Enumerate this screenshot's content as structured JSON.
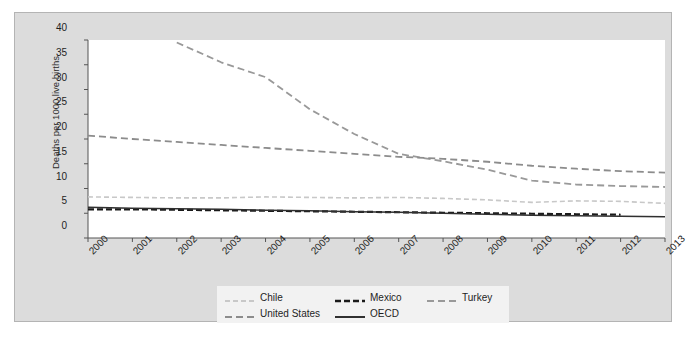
{
  "chart_data": {
    "type": "line",
    "title": "",
    "subtitle": "",
    "xlabel": "",
    "ylabel": "Deaths per 1000 live births",
    "xlim": [
      2000,
      2013
    ],
    "ylim": [
      0,
      40
    ],
    "yticks": [
      0,
      5,
      10,
      15,
      20,
      25,
      30,
      35,
      40
    ],
    "x": [
      2000,
      2001,
      2002,
      2003,
      2004,
      2005,
      2006,
      2007,
      2008,
      2009,
      2010,
      2011,
      2012,
      2013
    ],
    "categories": [
      "2000",
      "2001",
      "2002",
      "2003",
      "2004",
      "2005",
      "2006",
      "2007",
      "2008",
      "2009",
      "2010",
      "2011",
      "2012",
      "2013"
    ],
    "grid": false,
    "legend_position": "bottom",
    "series": [
      {
        "name": "Chile",
        "color": "#c8c8c8",
        "style": "dashed",
        "x": [
          2000,
          2001,
          2002,
          2003,
          2004,
          2005,
          2006,
          2007,
          2008,
          2009,
          2010,
          2011,
          2012,
          2013
        ],
        "values": [
          8.3,
          8.2,
          8.1,
          8.1,
          8.3,
          8.2,
          8.1,
          8.2,
          8.0,
          7.7,
          7.2,
          7.5,
          7.4,
          7.0
        ]
      },
      {
        "name": "Mexico",
        "color": "#1a1a1a",
        "style": "dashed",
        "x": [
          2000,
          2001,
          2002,
          2003,
          2004,
          2005,
          2006,
          2007,
          2008,
          2009,
          2010,
          2011,
          2012
        ],
        "values": [
          5.8,
          5.8,
          5.7,
          5.6,
          5.5,
          5.4,
          5.3,
          5.2,
          5.1,
          5.0,
          4.9,
          4.8,
          4.7
        ]
      },
      {
        "name": "Turkey",
        "color": "#999999",
        "style": "dashed",
        "x": [
          2002,
          2003,
          2004,
          2005,
          2006,
          2007,
          2008,
          2009,
          2010,
          2011,
          2012,
          2013
        ],
        "values": [
          39.5,
          35.5,
          32.5,
          26.0,
          21.0,
          17.0,
          15.5,
          13.8,
          11.6,
          10.8,
          10.5,
          10.3
        ]
      },
      {
        "name": "United States",
        "color": "#8c8c8c",
        "style": "dashed",
        "x": [
          2000,
          2001,
          2002,
          2003,
          2004,
          2005,
          2006,
          2007,
          2008,
          2009,
          2010,
          2011,
          2012,
          2013
        ],
        "values": [
          20.7,
          20.0,
          19.4,
          18.8,
          18.2,
          17.6,
          17.0,
          16.4,
          16.0,
          15.4,
          14.6,
          14.0,
          13.5,
          13.2
        ]
      },
      {
        "name": "OECD",
        "color": "#303030",
        "style": "solid",
        "x": [
          2000,
          2001,
          2002,
          2003,
          2004,
          2005,
          2006,
          2007,
          2008,
          2009,
          2010,
          2011,
          2012,
          2013
        ],
        "values": [
          6.2,
          6.0,
          5.9,
          5.8,
          5.6,
          5.5,
          5.3,
          5.2,
          5.0,
          4.8,
          4.6,
          4.5,
          4.4,
          4.3
        ]
      }
    ]
  },
  "legend": {
    "entries": [
      {
        "label": "Chile",
        "series": 0
      },
      {
        "label": "Mexico",
        "series": 1
      },
      {
        "label": "Turkey",
        "series": 2
      },
      {
        "label": "United States",
        "series": 3
      },
      {
        "label": "OECD",
        "series": 4
      }
    ]
  },
  "colors": {
    "panel_background": "#dcdcdc",
    "panel_border": "#b4b4b4",
    "plot_background": "#ffffff",
    "axis": "#555555",
    "legend_background": "#f2f2f2",
    "text": "#1e1e1e"
  }
}
